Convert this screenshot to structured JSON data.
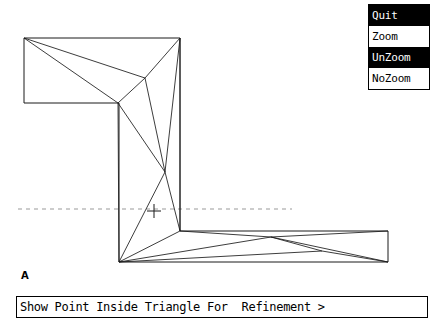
{
  "app": {
    "title": "Show Point Inside Triangle For  Refinement >",
    "figure_label": "A"
  },
  "menu": {
    "name": "zoom-menu",
    "items": [
      {
        "label": "Quit",
        "selected": true
      },
      {
        "label": "Zoom",
        "selected": false
      },
      {
        "label": "UnZoom",
        "selected": true
      },
      {
        "label": "NoZoom",
        "selected": false
      }
    ]
  },
  "status": {
    "text": "Show Point Inside Triangle For  Refinement >"
  },
  "figure": {
    "label": "A",
    "cursor": {
      "x": 154,
      "y": 211,
      "size": 7,
      "glyph": "crosshair"
    },
    "guide_line": {
      "y": 209,
      "x1": 18,
      "x2": 292,
      "style": "dashed"
    },
    "colors": {
      "stroke": "#1a1a1a",
      "guide": "#999999",
      "background": "#ffffff",
      "menu_highlight": "#000000"
    },
    "boundary": [
      [
        24,
        38
      ],
      [
        180,
        38
      ],
      [
        180,
        231
      ],
      [
        388,
        231
      ],
      [
        388,
        262
      ],
      [
        119,
        262
      ],
      [
        119,
        103
      ],
      [
        24,
        103
      ]
    ],
    "interior_vertices": [
      [
        145,
        78
      ],
      [
        118,
        103
      ],
      [
        165,
        172
      ],
      [
        180,
        231
      ],
      [
        271,
        237
      ],
      [
        322,
        251
      ]
    ],
    "edges": [
      [
        [
          24,
          38
        ],
        [
          145,
          78
        ]
      ],
      [
        [
          24,
          38
        ],
        [
          118,
          103
        ]
      ],
      [
        [
          145,
          78
        ],
        [
          180,
          38
        ]
      ],
      [
        [
          145,
          78
        ],
        [
          118,
          103
        ]
      ],
      [
        [
          145,
          78
        ],
        [
          165,
          172
        ]
      ],
      [
        [
          180,
          38
        ],
        [
          165,
          172
        ]
      ],
      [
        [
          180,
          38
        ],
        [
          180,
          231
        ]
      ],
      [
        [
          118,
          103
        ],
        [
          165,
          172
        ]
      ],
      [
        [
          118,
          103
        ],
        [
          119,
          262
        ]
      ],
      [
        [
          165,
          172
        ],
        [
          119,
          262
        ]
      ],
      [
        [
          165,
          172
        ],
        [
          180,
          231
        ]
      ],
      [
        [
          180,
          231
        ],
        [
          119,
          262
        ]
      ],
      [
        [
          119,
          262
        ],
        [
          271,
          237
        ]
      ],
      [
        [
          119,
          262
        ],
        [
          322,
          251
        ]
      ],
      [
        [
          180,
          231
        ],
        [
          271,
          237
        ]
      ],
      [
        [
          271,
          237
        ],
        [
          322,
          251
        ]
      ],
      [
        [
          271,
          237
        ],
        [
          388,
          262
        ]
      ],
      [
        [
          322,
          251
        ],
        [
          388,
          262
        ]
      ],
      [
        [
          271,
          237
        ],
        [
          388,
          231
        ]
      ]
    ]
  }
}
